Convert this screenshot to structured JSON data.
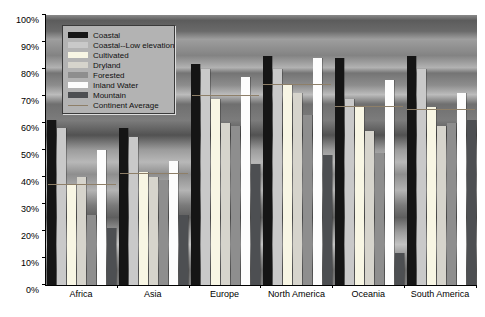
{
  "chart_data": {
    "type": "bar",
    "title": "",
    "xlabel": "",
    "ylabel": "",
    "ylim": [
      0,
      100
    ],
    "grid": false,
    "legend_position": "top-left",
    "y_ticks": [
      "0%",
      "10%",
      "20%",
      "30%",
      "40%",
      "50%",
      "60%",
      "70%",
      "80%",
      "90%",
      "100%"
    ],
    "categories": [
      "Africa",
      "Asia",
      "Europe",
      "North America",
      "Oceania",
      "South America"
    ],
    "series": [
      {
        "name": "Coastal",
        "type": "bar",
        "color": "#151515",
        "values": [
          61,
          58,
          82,
          85,
          84,
          85
        ]
      },
      {
        "name": "Coastal--Low elevation",
        "type": "bar",
        "color": "#c9c9c9",
        "values": [
          58,
          55,
          80,
          80,
          69,
          80
        ]
      },
      {
        "name": "Cultivated",
        "type": "bar",
        "color": "#f8f6e4",
        "values": [
          37,
          42,
          69,
          74,
          66,
          66
        ]
      },
      {
        "name": "Dryland",
        "type": "bar",
        "color": "#d6d4cc",
        "values": [
          40,
          40,
          60,
          71,
          57,
          59
        ]
      },
      {
        "name": "Forested",
        "type": "bar",
        "color": "#8e8e8e",
        "values": [
          26,
          39,
          59,
          63,
          49,
          60
        ]
      },
      {
        "name": "Inland Water",
        "type": "bar",
        "color": "#fdfdfd",
        "values": [
          50,
          46,
          77,
          84,
          76,
          71
        ]
      },
      {
        "name": "Mountain",
        "type": "bar",
        "color": "#4d4f52",
        "values": [
          21,
          26,
          45,
          48,
          12,
          61
        ]
      },
      {
        "name": "Continent Average",
        "type": "line",
        "color": "#8e7f68",
        "values": [
          37,
          41,
          70,
          74,
          66,
          65
        ]
      }
    ]
  }
}
